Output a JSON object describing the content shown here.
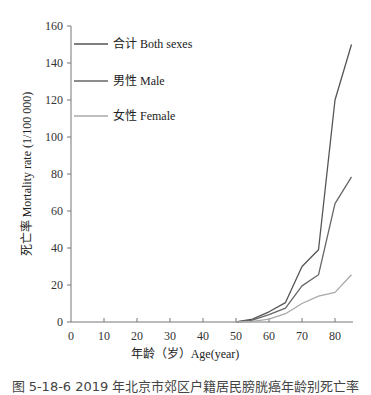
{
  "chart_data": {
    "type": "line",
    "title": "",
    "xlabel": "年龄（岁）Age(year)",
    "ylabel": "死亡率 Mortality rate (1/100 000)",
    "xlim": [
      0,
      85
    ],
    "ylim": [
      0,
      160
    ],
    "x_ticks": [
      0,
      10,
      20,
      30,
      40,
      50,
      60,
      70,
      80
    ],
    "y_ticks": [
      0,
      20,
      40,
      60,
      80,
      100,
      120,
      140,
      160
    ],
    "grid": false,
    "legend_position": "upper-left",
    "legend": [
      "合计 Both sexes",
      "男性 Male",
      "女性 Female"
    ],
    "x": [
      50,
      55,
      60,
      65,
      70,
      75,
      80,
      85
    ],
    "series": [
      {
        "name": "男性 Male",
        "color": "#555555",
        "values": [
          0,
          1.5,
          5.5,
          10.5,
          30,
          39,
          120,
          150
        ]
      },
      {
        "name": "合计 Both sexes",
        "color": "#666666",
        "values": [
          0,
          1,
          4,
          7.5,
          19.5,
          25.5,
          64,
          78.5
        ]
      },
      {
        "name": "女性 Female",
        "color": "#a8a8a8",
        "values": [
          0,
          0.3,
          1.5,
          4.5,
          10,
          14,
          16,
          25.5
        ]
      }
    ]
  },
  "legend": {
    "items": [
      {
        "label": "合计 Both sexes",
        "color": "#555555"
      },
      {
        "label": "男性 Male",
        "color": "#666666"
      },
      {
        "label": "女性 Female",
        "color": "#a8a8a8"
      }
    ]
  },
  "caption": "图 5-18-6  2019 年北京市郊区户籍居民膀胱癌年龄别死亡率"
}
